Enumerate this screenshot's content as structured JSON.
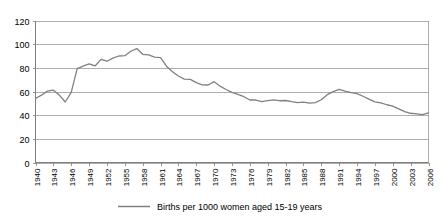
{
  "chart_data": {
    "type": "line",
    "title": "",
    "xlabel": "",
    "ylabel": "",
    "ylim": [
      0,
      120
    ],
    "ytick_values": [
      0,
      20,
      40,
      60,
      80,
      100,
      120
    ],
    "ytick_labels": [
      "0",
      "20",
      "40",
      "60",
      "80",
      "100",
      "120"
    ],
    "grid": true,
    "grid_axis": "y",
    "legend_position": "bottom",
    "legend": [
      "Births per 1000 women aged 15-19 years"
    ],
    "xtick_labels": [
      "1940",
      "1943",
      "1946",
      "1949",
      "1952",
      "1955",
      "1958",
      "1961",
      "1964",
      "1967",
      "1970",
      "1973",
      "1976",
      "1979",
      "1982",
      "1985",
      "1988",
      "1991",
      "1994",
      "1997",
      "2000",
      "2003",
      "2006"
    ],
    "xlim": [
      1940,
      2006
    ],
    "series": [
      {
        "name": "Births per 1000 women aged 15-19 years",
        "color": "#808080",
        "x": [
          1940,
          1941,
          1942,
          1943,
          1944,
          1945,
          1946,
          1947,
          1948,
          1949,
          1950,
          1951,
          1952,
          1953,
          1954,
          1955,
          1956,
          1957,
          1958,
          1959,
          1960,
          1961,
          1962,
          1963,
          1964,
          1965,
          1966,
          1967,
          1968,
          1969,
          1970,
          1971,
          1972,
          1973,
          1974,
          1975,
          1976,
          1977,
          1978,
          1979,
          1980,
          1981,
          1982,
          1983,
          1984,
          1985,
          1986,
          1987,
          1988,
          1989,
          1990,
          1991,
          1992,
          1993,
          1994,
          1995,
          1996,
          1997,
          1998,
          1999,
          2000,
          2001,
          2002,
          2003,
          2004,
          2005,
          2006
        ],
        "values": [
          54.1,
          56.9,
          60.3,
          61.1,
          57.0,
          51.1,
          59.3,
          79.3,
          81.5,
          83.4,
          81.6,
          87.1,
          85.6,
          88.2,
          90.0,
          90.3,
          94.0,
          96.3,
          91.4,
          90.9,
          89.1,
          88.6,
          81.4,
          76.7,
          73.1,
          70.5,
          70.3,
          67.5,
          65.6,
          65.5,
          68.3,
          64.5,
          61.7,
          59.3,
          57.5,
          55.6,
          52.8,
          52.8,
          51.5,
          52.3,
          53.0,
          52.2,
          52.4,
          51.4,
          50.6,
          51.0,
          50.2,
          50.6,
          53.0,
          57.3,
          59.9,
          61.8,
          60.3,
          59.0,
          58.2,
          56.0,
          53.5,
          51.3,
          50.3,
          48.8,
          47.7,
          45.3,
          43.0,
          41.6,
          41.1,
          40.5,
          41.9
        ]
      }
    ]
  },
  "legend": {
    "entries": [
      {
        "label": "Births per 1000 women aged 15-19 years",
        "color": "#808080"
      }
    ]
  }
}
